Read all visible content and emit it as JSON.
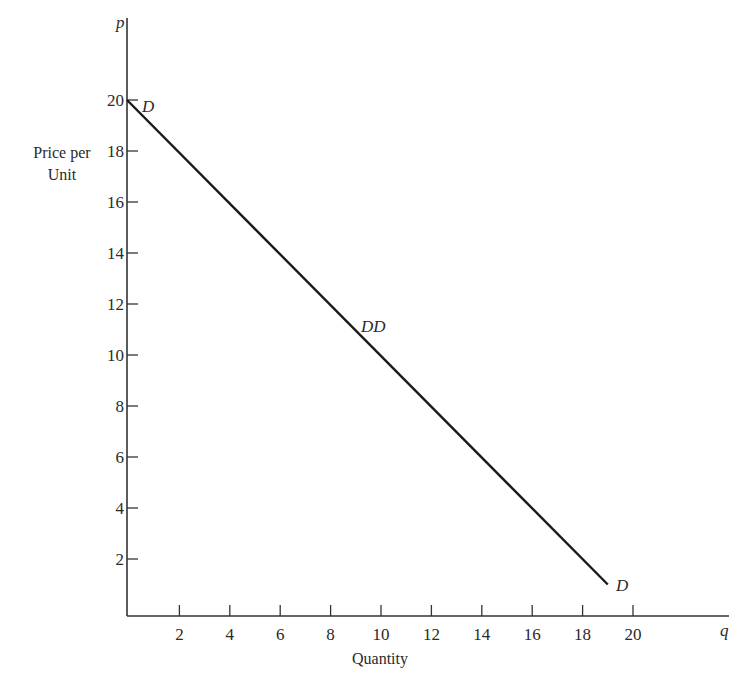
{
  "chart_data": {
    "type": "line",
    "title": "",
    "xlabel": "Quantity",
    "ylabel": "Price per Unit",
    "x_axis_symbol": "q",
    "y_axis_symbol": "p",
    "xlim": [
      0,
      23.5
    ],
    "ylim": [
      0,
      23
    ],
    "x_ticks": [
      2,
      4,
      6,
      8,
      10,
      12,
      14,
      16,
      18,
      20
    ],
    "y_ticks": [
      2,
      4,
      6,
      8,
      10,
      12,
      14,
      16,
      18,
      20
    ],
    "grid": false,
    "legend": null,
    "series": [
      {
        "name": "DD",
        "equation": "p = 20 - q",
        "x": [
          0,
          19
        ],
        "y": [
          20,
          1
        ]
      }
    ],
    "annotations": [
      {
        "text": "D",
        "x": 0,
        "y": 20,
        "position": "right-of-point"
      },
      {
        "text": "DD",
        "x": 9.5,
        "y": 10.6,
        "position": "above-line"
      },
      {
        "text": "D",
        "x": 19,
        "y": 1,
        "position": "right-of-point"
      }
    ]
  },
  "labels": {
    "y_title_line1": "Price per",
    "y_title_line2": "Unit",
    "x_title": "Quantity",
    "y_symbol": "p",
    "x_symbol": "q",
    "start_label": "D",
    "mid_label": "DD",
    "end_label": "D"
  },
  "style": {
    "axis_color": "#333333",
    "line_color": "#1a1a1a",
    "text_color": "#2a2a2a",
    "background": "#ffffff"
  }
}
